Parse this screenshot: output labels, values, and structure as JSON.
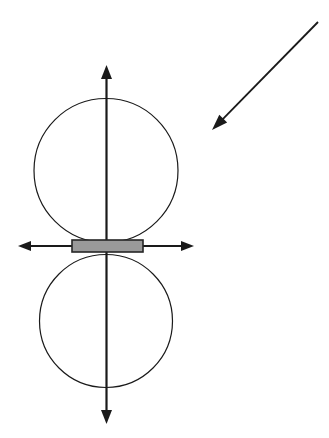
{
  "figure": {
    "background_color": "#ffffff",
    "canvas": {
      "width": 329,
      "height": 438
    },
    "stroke_color": "#1a1a1a",
    "rect_fill_color": "#9a9a9a",
    "rect_border_color": "#262626"
  },
  "vertical_axis": {
    "label": "vertical double-headed axis arrow",
    "x": 106.5,
    "y_top_tip": 65,
    "y_bottom_tip": 424,
    "stroke_width": 2.2,
    "arrowhead_length": 14,
    "arrowhead_width": 11
  },
  "horizontal_axis": {
    "label": "horizontal double-headed axis arrow",
    "y": 246,
    "x_left_tip": 18,
    "x_right_tip": 194,
    "stroke_width": 2.0,
    "arrowhead_length": 13,
    "arrowhead_width": 10
  },
  "upper_lobe": {
    "label": "upper circular lobe",
    "cx": 106,
    "cy": 170.5,
    "r": 72,
    "stroke_width": 1.2
  },
  "lower_lobe": {
    "label": "lower circular lobe",
    "cx": 106,
    "cy": 321,
    "r": 66.5,
    "stroke_width": 1.2
  },
  "center_rectangle": {
    "label": "gray center element rectangle",
    "x": 72,
    "y": 240,
    "width": 71,
    "height": 12,
    "stroke_width": 1.6
  },
  "incident_arrow": {
    "label": "incident diagonal arrow pointing down-left",
    "x_start": 318,
    "y_start": 22,
    "x_tip": 212,
    "y_tip": 130,
    "stroke_width": 1.8,
    "arrowhead_length": 16,
    "arrowhead_width": 11
  },
  "annotations": []
}
